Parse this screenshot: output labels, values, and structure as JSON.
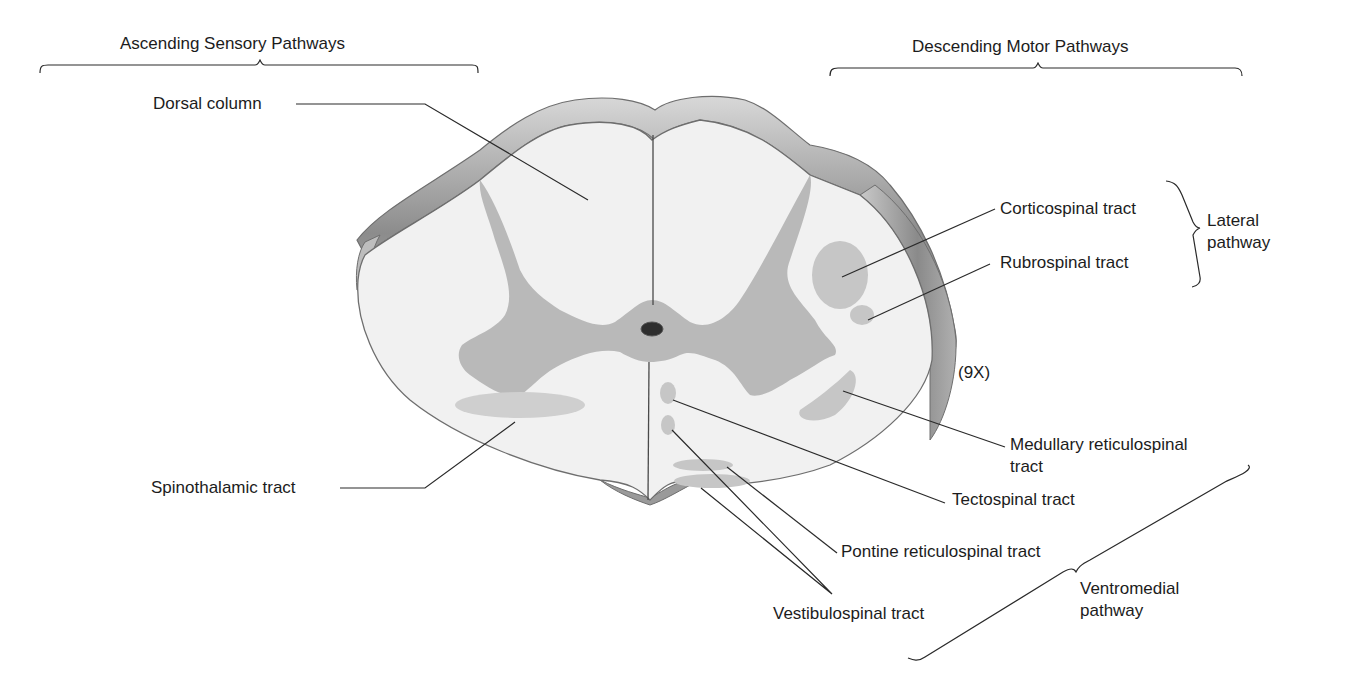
{
  "diagram": {
    "colors": {
      "white_matter": "#f1f1f1",
      "gray_matter": "#b9b9b9",
      "tract_highlight": "#cdcdcd",
      "outline": "#6e6e6e",
      "leader_line": "#2a2a2a",
      "surface_shadow": "#9a9a9a"
    },
    "groups": {
      "ascending": {
        "title": "Ascending Sensory Pathways"
      },
      "descending": {
        "title": "Descending Motor Pathways"
      }
    },
    "sub_groups": {
      "lateral": {
        "line1": "Lateral",
        "line2": "pathway"
      },
      "ventromedial": {
        "line1": "Ventromedial",
        "line2": "pathway"
      }
    },
    "labels": {
      "dorsal_column": "Dorsal column",
      "spinothalamic": "Spinothalamic tract",
      "corticospinal": "Corticospinal tract",
      "rubrospinal": "Rubrospinal tract",
      "medullary_line1": "Medullary reticulospinal",
      "medullary_line2": "tract",
      "tectospinal": "Tectospinal tract",
      "pontine": "Pontine reticulospinal tract",
      "vestibulospinal": "Vestibulospinal tract"
    },
    "magnification": "(9X)"
  }
}
